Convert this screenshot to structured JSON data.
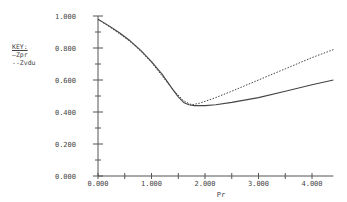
{
  "chart_data": {
    "type": "line",
    "title": "",
    "xlabel": "Pr",
    "ylabel": "",
    "xlim": [
      0,
      4.4
    ],
    "ylim": [
      0,
      1.0
    ],
    "grid": false,
    "legend_position": "left",
    "x_ticks": [
      "0.000",
      "1.000",
      "2.000",
      "3.000",
      "4.000"
    ],
    "y_ticks": [
      "0.000",
      "0.200",
      "0.400",
      "0.600",
      "0.800",
      "1.000"
    ],
    "legend": {
      "title": "KEY:",
      "entries": [
        {
          "marker": "—",
          "label": "Zpr",
          "style": "solid"
        },
        {
          "marker": "--",
          "label": "Zvdu",
          "style": "dotted"
        }
      ]
    },
    "series": [
      {
        "name": "Zpr",
        "style": "solid",
        "x": [
          0.0,
          0.2,
          0.4,
          0.6,
          0.8,
          1.0,
          1.2,
          1.4,
          1.5,
          1.6,
          1.7,
          1.8,
          2.0,
          2.2,
          2.5,
          3.0,
          3.5,
          4.0,
          4.4
        ],
        "y": [
          0.98,
          0.94,
          0.895,
          0.845,
          0.785,
          0.715,
          0.635,
          0.54,
          0.495,
          0.46,
          0.445,
          0.44,
          0.44,
          0.445,
          0.46,
          0.49,
          0.53,
          0.57,
          0.6
        ]
      },
      {
        "name": "Zvdu",
        "style": "dotted",
        "x": [
          0.0,
          0.2,
          0.4,
          0.6,
          0.8,
          1.0,
          1.2,
          1.4,
          1.6,
          1.75,
          1.9,
          2.2,
          2.5,
          3.0,
          3.5,
          4.0,
          4.4
        ],
        "y": [
          0.98,
          0.935,
          0.89,
          0.84,
          0.78,
          0.71,
          0.625,
          0.54,
          0.47,
          0.445,
          0.455,
          0.49,
          0.53,
          0.6,
          0.67,
          0.74,
          0.79
        ]
      }
    ]
  }
}
